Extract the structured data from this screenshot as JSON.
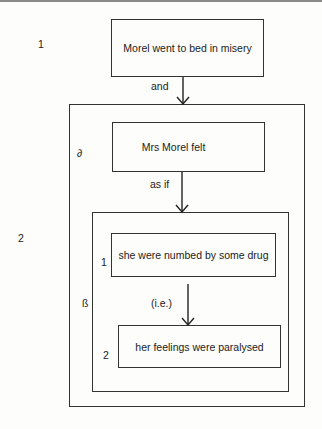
{
  "diagram": {
    "type": "clause-complex analysis",
    "levels": [
      {
        "label": "1"
      },
      {
        "label": "2"
      }
    ],
    "nodes": {
      "clause_1": {
        "text": "Morel went to bed in misery"
      },
      "alpha": {
        "symbol": "∂",
        "text": "Mrs Morel felt"
      },
      "beta": {
        "symbol": "ß"
      },
      "beta_1": {
        "number": "1",
        "text": "she were numbed by some drug"
      },
      "beta_2": {
        "number": "2",
        "text": "her feelings were paralysed"
      }
    },
    "links": [
      {
        "from": "clause_1",
        "to": "level_2",
        "label": "and"
      },
      {
        "from": "alpha",
        "to": "beta",
        "label": "as if"
      },
      {
        "from": "beta_1",
        "to": "beta_2",
        "label": "(i.e.)"
      }
    ]
  }
}
